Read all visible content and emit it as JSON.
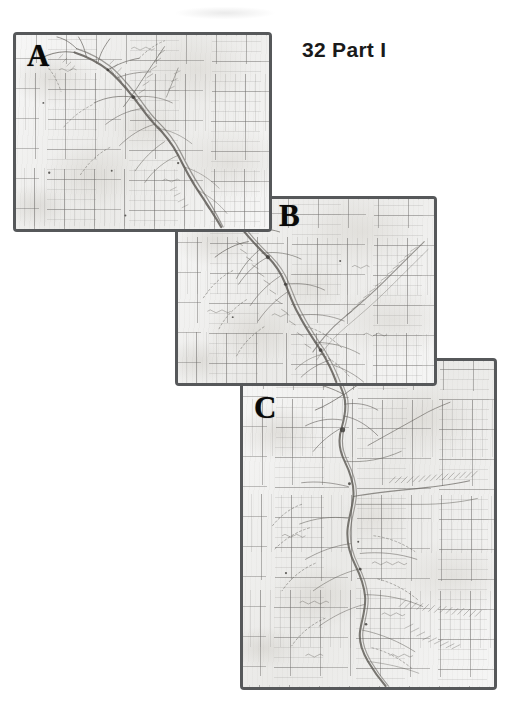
{
  "page": {
    "header": "32 Part I",
    "background_color": "#ffffff"
  },
  "plate": {
    "description": "Scanned historical manuscript survey map reproduced in three overlapping sheet sections arranged in a descending diagonal cascade from upper-left to lower-right.",
    "paper_color": "#ececeb",
    "border_color": "#56585a",
    "ink_color": "#5d5a55",
    "panels": [
      {
        "id": "a",
        "label": "A",
        "x": 13,
        "y": 32,
        "width": 259,
        "height": 200,
        "content": "grid-ruled manuscript map sheet with hand-drawn river channel running from upper-left toward lower-right, tributary branches and hachured banks"
      },
      {
        "id": "b",
        "label": "B",
        "x": 175,
        "y": 196,
        "width": 262,
        "height": 190,
        "content": "grid-ruled manuscript map sheet continuing the river course through the centre with branching creeks and a long diagonal ridge line at right"
      },
      {
        "id": "c",
        "label": "C",
        "x": 240,
        "y": 358,
        "width": 257,
        "height": 332,
        "content": "grid-ruled manuscript map sheet showing the river widening southward with dense hachured tributaries, annotated ridge hachures and settlement marks"
      }
    ]
  }
}
